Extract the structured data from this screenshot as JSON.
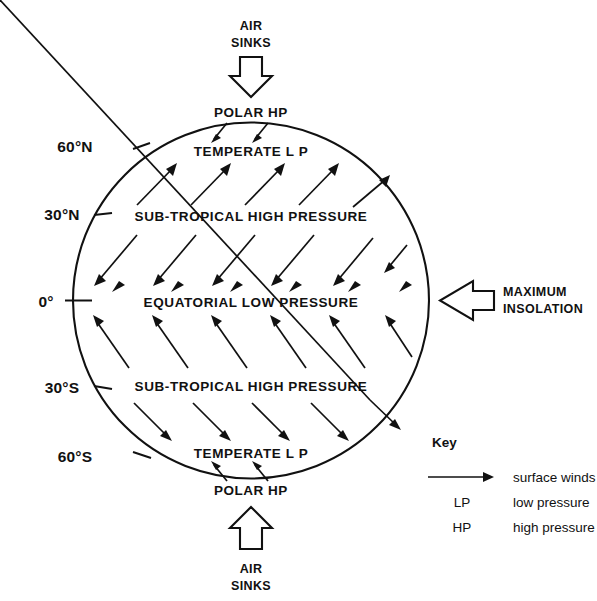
{
  "diagram": {
    "top_external": {
      "line1": "AIR",
      "line2": "SINKS",
      "arrow": "hollow-arrow-down"
    },
    "bottom_external": {
      "line1": "AIR",
      "line2": "SINKS",
      "arrow": "hollow-arrow-up"
    },
    "right_external": {
      "line1": "MAXIMUM",
      "line2": "INSOLATION",
      "arrow": "hollow-arrow-left"
    },
    "bands": {
      "polar_hp_north": "POLAR HP",
      "temperate_lp_north": "TEMPERATE  L P",
      "sub_tropical_high_north": "SUB-TROPICAL HIGH PRESSURE",
      "equatorial_low": "EQUATORIAL LOW PRESSURE",
      "sub_tropical_high_south": "SUB-TROPICAL HIGH PRESSURE",
      "temperate_lp_south": "TEMPERATE  L P",
      "polar_hp_south": "POLAR HP"
    },
    "latitudes": [
      {
        "label": "60°N"
      },
      {
        "label": "30°N"
      },
      {
        "label": "0°"
      },
      {
        "label": "30°S"
      },
      {
        "label": "60°S"
      }
    ],
    "colors": {
      "ink": "#111111",
      "background": "#ffffff"
    }
  },
  "key": {
    "title": "Key",
    "rows": [
      {
        "symbol": "→",
        "symbol_name": "arrow-right-icon",
        "text": "surface winds"
      },
      {
        "symbol": "LP",
        "symbol_name": "lp-abbreviation",
        "text": "low pressure"
      },
      {
        "symbol": "HP",
        "symbol_name": "hp-abbreviation",
        "text": "high pressure"
      }
    ]
  }
}
